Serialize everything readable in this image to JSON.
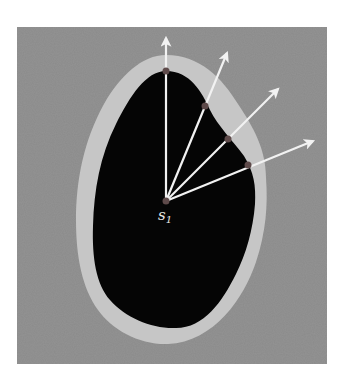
{
  "figure": {
    "colors": {
      "background": "#8a8a8a",
      "band": "#c6c6c6",
      "region": "#050505",
      "ray": "#f2f2f2",
      "point": "#5e4a4a"
    },
    "seed": {
      "label": "s",
      "subscript": "1",
      "x": 166,
      "y": 201
    },
    "rays": [
      {
        "id": 1,
        "boundary_point": [
          166,
          71
        ],
        "tip": [
          166,
          37
        ]
      },
      {
        "id": 2,
        "boundary_point": [
          205,
          106
        ],
        "tip": [
          228,
          52
        ]
      },
      {
        "id": 3,
        "boundary_point": [
          228,
          139
        ],
        "tip": [
          279,
          88
        ]
      },
      {
        "id": 4,
        "boundary_point": [
          248,
          165
        ],
        "tip": [
          314,
          140
        ]
      }
    ]
  }
}
